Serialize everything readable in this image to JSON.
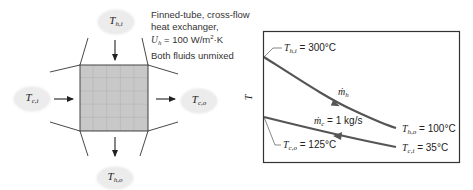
{
  "schematic": {
    "description_lines": [
      "Finned-tube, cross-flow",
      "heat exchanger,",
      "U_h = 100 W/m²·K",
      "Both fluids unmixed"
    ],
    "description": {
      "line1": "Finned-tube, cross-flow",
      "line2": "heat exchanger,",
      "u_symbol": "U",
      "u_sub": "h",
      "u_value": " = 100 W/m",
      "u_exp": "2",
      "u_unit": "·K",
      "line4": "Both fluids unmixed"
    },
    "streams": {
      "hot_in": {
        "symbol": "T",
        "sub": "h,i"
      },
      "hot_out": {
        "symbol": "T",
        "sub": "h,o"
      },
      "cold_in": {
        "symbol": "T",
        "sub": "c,i"
      },
      "cold_out": {
        "symbol": "T",
        "sub": "c,o"
      }
    },
    "grid": {
      "rows": 5,
      "cols": 5
    },
    "colors": {
      "core_fill": "#c8c8c8",
      "core_grid": "#9a9a9a",
      "cloud_fill": "#ececec",
      "line": "#333333"
    }
  },
  "chart": {
    "y_axis_label": "T",
    "hot_inlet": {
      "symbol": "T",
      "sub": "h,i",
      "value": " = 300°C"
    },
    "hot_outlet": {
      "symbol": "T",
      "sub": "h,o",
      "value": " = 100°C"
    },
    "cold_inlet": {
      "symbol": "T",
      "sub": "c,i",
      "value": " = 35°C"
    },
    "cold_outlet": {
      "symbol": "T",
      "sub": "c,o",
      "value": " = 125°C"
    },
    "hot_flow": {
      "symbol": "ṁ",
      "sub": "h"
    },
    "cold_flow": {
      "symbol": "ṁ",
      "sub": "c",
      "value": " = 1 kg/s"
    },
    "colors": {
      "curve": "#555555",
      "frame": "#333333"
    }
  }
}
